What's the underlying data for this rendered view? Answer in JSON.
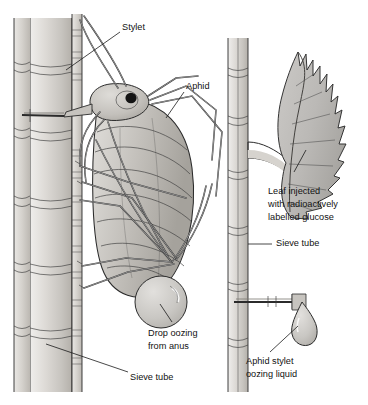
{
  "figure": {
    "background_color": "#ffffff",
    "ink_color": "#2b2b2b",
    "label_color": "#121212"
  },
  "labels": {
    "stylet": "Stylet",
    "aphid": "Aphid",
    "drop_oozing_line1": "Drop oozing",
    "drop_oozing_line2": "from anus",
    "sieve_tube_left": "Sieve tube",
    "leaf_injected_line1": "Leaf injected",
    "leaf_injected_line2": "with radioactively",
    "leaf_injected_line3": "labelled glucose",
    "sieve_tube_right": "Sieve tube",
    "aphid_stylet_line1": "Aphid stylet",
    "aphid_stylet_line2": "oozing liquid"
  },
  "palette": {
    "tube_light": "#e3e1de",
    "tube_mid": "#cecbc6",
    "tube_shade": "#b6b2ac",
    "body_light": "#d3d1cd",
    "body_mid": "#bcb9b4",
    "body_dark": "#a3a09a",
    "leaf_fill": "#c0bfbd",
    "leaf_shade": "#aaa8a4",
    "drop_fill": "#c9c7c3",
    "eye_dark": "#141414",
    "paper": "#ffffff"
  },
  "parts": {
    "left_sieve_tube": "left-sieve-tube",
    "left_sieve_tube_wall": "left-tube-wall",
    "aphid_body": "aphid-body",
    "aphid_head": "aphid-head",
    "aphid_eye": "aphid-eye",
    "aphid_legs": "aphid-legs",
    "aphid_antennae": "aphid-antennae",
    "stylet_probe": "stylet-probe",
    "anus_drop": "anus-drop",
    "right_stem": "right-stem",
    "leaf": "serrated-leaf",
    "petiole": "leaf-petiole",
    "severed_stylet": "severed-stylet",
    "stylet_drop": "stylet-drop"
  }
}
